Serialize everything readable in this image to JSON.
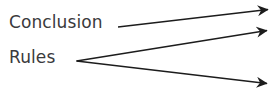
{
  "canvas": {
    "width": 279,
    "height": 111,
    "background_color": "#ffffff"
  },
  "diagram": {
    "type": "arrow-flow-diagram",
    "stroke_color": "#1c1c1c",
    "text_color": "#3a3a3c",
    "labels": [
      {
        "id": "conclusion",
        "text": "Conclusion",
        "x": 9,
        "y": 14,
        "font_size": 17
      },
      {
        "id": "rules",
        "text": "Rules",
        "x": 9,
        "y": 49,
        "font_size": 17
      }
    ],
    "vertices": [
      {
        "id": "rules-vertex",
        "x": 76,
        "y": 61,
        "description": "shared origin point of the two Rules arrows"
      }
    ],
    "arrows": [
      {
        "id": "arrow-conclusion",
        "from_label": "Conclusion",
        "x1": 118,
        "y1": 27,
        "x2": 277,
        "y2": 8,
        "direction": "up-right",
        "head": "barbed"
      },
      {
        "id": "arrow-rules-upper",
        "from_label": "Rules",
        "x1": 76,
        "y1": 61,
        "x2": 277,
        "y2": 29,
        "direction": "up-right",
        "head": "barbed"
      },
      {
        "id": "arrow-rules-lower",
        "from_label": "Rules",
        "x1": 76,
        "y1": 61,
        "x2": 277,
        "y2": 85,
        "direction": "down-right",
        "head": "barbed"
      }
    ]
  }
}
